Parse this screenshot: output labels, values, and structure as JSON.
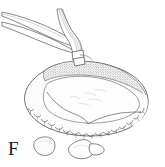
{
  "figure": {
    "panel_label": "F",
    "caption_text": "",
    "background_color": "#ffffff",
    "ink_color": "#3a3a3a",
    "stipple_color": "#6e6e6e",
    "fill_color": "#fbfbfb",
    "medium": "line drawing with stipple shading"
  },
  "elements": {
    "instrument_upper_left": {
      "name": "forceps-arm",
      "label": "",
      "description": "slender tapering instrument entering from upper left, angled down to the right"
    },
    "instrument_vertical": {
      "name": "probe-shaft",
      "label": "",
      "description": "curved hatched shaft descending from top, ending in a banded tip that contacts the specimen rim"
    },
    "specimen": {
      "name": "shell-valve",
      "label": "",
      "description": "broad ovoid body with stippled upper rim and crenulated scalloped lower margin"
    },
    "fragments": [
      {
        "name": "fragment-small-left",
        "label": ""
      },
      {
        "name": "fragment-large-center",
        "label": ""
      },
      {
        "name": "fragment-tail-right",
        "label": ""
      }
    ]
  }
}
